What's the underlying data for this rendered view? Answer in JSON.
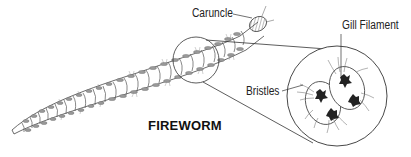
{
  "diagram": {
    "title": "FIREWORM",
    "labels": {
      "caruncle": "Caruncle",
      "gill_filament": "Gill Filament",
      "bristles": "Bristles"
    },
    "parts": [
      "worm-body",
      "head",
      "magnified-segment-inset"
    ],
    "colors": {
      "line": "#333333",
      "fill_light": "#d8d8d8",
      "fill_dark": "#222222",
      "background": "#ffffff"
    }
  }
}
